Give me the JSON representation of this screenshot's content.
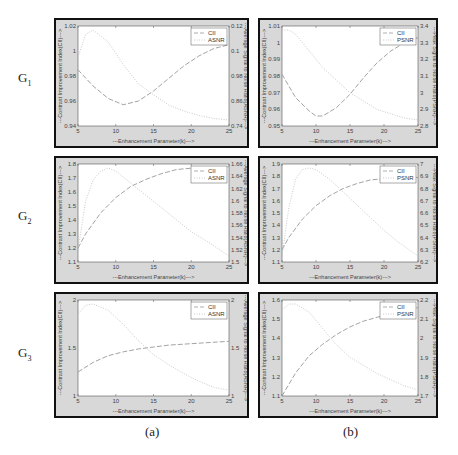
{
  "figure": {
    "row_labels": [
      "G",
      "G",
      "G"
    ],
    "row_subs": [
      "1",
      "2",
      "3"
    ],
    "col_captions": [
      "(a)",
      "(b)"
    ]
  },
  "chart_data": [
    {
      "id": "G1a",
      "type": "line",
      "row": "G1",
      "col": "(a)",
      "xlabel": "---Enhancement Parameter(k)--->",
      "ylabel_left": "---Contrast Improvement Index(CII)--->",
      "ylabel_right": "---Average Signal to Noise Ratio(ASNR)--->",
      "x_ticks": [
        "5",
        "10",
        "15",
        "20",
        "25"
      ],
      "xlim": [
        5,
        25
      ],
      "yleft_ticks": [
        "0.94",
        "0.96",
        "0.98",
        "1",
        "1.02"
      ],
      "ylim_left": [
        0.94,
        1.02
      ],
      "yright_ticks": [
        "0.74",
        "0.86",
        "0.98",
        "0.1",
        "0.12"
      ],
      "legend": [
        "CII",
        "ASNR"
      ],
      "series": [
        {
          "name": "CII",
          "axis": "left",
          "x": [
            5,
            7,
            9,
            11,
            13,
            15,
            17,
            19,
            21,
            23,
            25
          ],
          "values": [
            0.985,
            0.972,
            0.962,
            0.957,
            0.96,
            0.968,
            0.978,
            0.988,
            0.996,
            1.002,
            1.005
          ]
        },
        {
          "name": "ASNR",
          "axis": "right",
          "x": [
            5,
            6,
            7,
            9,
            11,
            13,
            15,
            17,
            19,
            21,
            23,
            25
          ],
          "values": [
            0.98,
            0.995,
            0.998,
            0.99,
            0.975,
            0.962,
            0.955,
            0.948,
            0.944,
            0.941,
            0.939,
            0.938
          ]
        }
      ]
    },
    {
      "id": "G1b",
      "type": "line",
      "row": "G1",
      "col": "(b)",
      "xlabel": "---Enhancement Parameter(k)--->",
      "ylabel_left": "---Contrast Improvement Index(CII)--->",
      "ylabel_right": "---Peak Signal to Noise Ratio(PSNR)--->",
      "x_ticks": [
        "5",
        "10",
        "15",
        "20",
        "25"
      ],
      "xlim": [
        5,
        25
      ],
      "yleft_ticks": [
        "0.95",
        "0.96",
        "0.97",
        "0.98",
        "0.99",
        "1",
        "1.01"
      ],
      "ylim_left": [
        0.95,
        1.01
      ],
      "yright_ticks": [
        "2.8",
        "2.9",
        "3",
        "3.1",
        "3.2",
        "3.3",
        "3.4"
      ],
      "legend": [
        "CII",
        "PSNR"
      ],
      "series": [
        {
          "name": "CII",
          "axis": "left",
          "x": [
            5,
            7,
            9,
            10,
            11,
            13,
            15,
            17,
            19,
            21,
            23,
            25
          ],
          "values": [
            0.981,
            0.967,
            0.959,
            0.956,
            0.956,
            0.961,
            0.969,
            0.979,
            0.988,
            0.995,
            1.0,
            1.003
          ]
        },
        {
          "name": "PSNR",
          "axis": "right",
          "x": [
            5,
            6,
            7,
            9,
            11,
            13,
            15,
            17,
            19,
            21,
            23,
            25
          ],
          "values": [
            3.3,
            3.3,
            3.28,
            3.2,
            3.12,
            3.06,
            3.0,
            2.96,
            2.92,
            2.9,
            2.88,
            2.87
          ]
        }
      ]
    },
    {
      "id": "G2a",
      "type": "line",
      "row": "G2",
      "col": "(a)",
      "xlabel": "---Enhancement Parameter(k)--->",
      "ylabel_left": "---Contrast Improvement Index(CII)--->",
      "ylabel_right": "---Average Signal to Noise Ratio(ASNR)--->",
      "x_ticks": [
        "5",
        "10",
        "15",
        "20",
        "25"
      ],
      "xlim": [
        5,
        25
      ],
      "yleft_ticks": [
        "1.1",
        "1.2",
        "1.3",
        "1.4",
        "1.5",
        "1.6",
        "1.7",
        "1.8"
      ],
      "ylim_left": [
        1.1,
        1.8
      ],
      "yright_ticks": [
        "1.5",
        "1.52",
        "1.54",
        "1.56",
        "1.58",
        "1.6",
        "1.62",
        "1.64",
        "1.66"
      ],
      "legend": [
        "CII",
        "ASNR"
      ],
      "series": [
        {
          "name": "CII",
          "axis": "left",
          "x": [
            5,
            6,
            8,
            10,
            12,
            14,
            16,
            18,
            20,
            22,
            25
          ],
          "values": [
            1.2,
            1.3,
            1.45,
            1.56,
            1.64,
            1.69,
            1.73,
            1.76,
            1.77,
            1.77,
            1.78
          ]
        },
        {
          "name": "ASNR",
          "axis": "right",
          "x": [
            5,
            6,
            7,
            8,
            9,
            10,
            12,
            14,
            16,
            18,
            20,
            22,
            25
          ],
          "values": [
            1.52,
            1.6,
            1.635,
            1.65,
            1.655,
            1.65,
            1.63,
            1.61,
            1.59,
            1.57,
            1.55,
            1.535,
            1.51
          ]
        }
      ]
    },
    {
      "id": "G2b",
      "type": "line",
      "row": "G2",
      "col": "(b)",
      "xlabel": "---Enhancement Parameter(k)--->",
      "ylabel_left": "---Contrast Improvement Index(CII)--->",
      "ylabel_right": "---Peak Signal to Noise Ratio(PSNR)--->",
      "x_ticks": [
        "5",
        "10",
        "15",
        "20",
        "25"
      ],
      "xlim": [
        5,
        25
      ],
      "yleft_ticks": [
        "1.1",
        "1.2",
        "1.3",
        "1.4",
        "1.5",
        "1.6",
        "1.7",
        "1.8",
        "1.9"
      ],
      "ylim_left": [
        1.1,
        1.9
      ],
      "yright_ticks": [
        "6.2",
        "6.3",
        "6.4",
        "6.5",
        "6.6",
        "6.7",
        "6.8",
        "6.9",
        "7"
      ],
      "legend": [
        "CII",
        "PSNR"
      ],
      "series": [
        {
          "name": "CII",
          "axis": "left",
          "x": [
            5,
            6,
            8,
            10,
            12,
            14,
            16,
            18,
            20,
            22,
            25
          ],
          "values": [
            1.2,
            1.3,
            1.45,
            1.56,
            1.64,
            1.7,
            1.74,
            1.77,
            1.78,
            1.79,
            1.79
          ]
        },
        {
          "name": "PSNR",
          "axis": "right",
          "x": [
            5,
            6,
            7,
            8,
            9,
            10,
            12,
            14,
            16,
            18,
            20,
            22,
            25
          ],
          "values": [
            6.3,
            6.6,
            6.78,
            6.84,
            6.85,
            6.84,
            6.78,
            6.7,
            6.62,
            6.54,
            6.46,
            6.39,
            6.3
          ]
        }
      ]
    },
    {
      "id": "G3a",
      "type": "line",
      "row": "G3",
      "col": "(a)",
      "xlabel": "---Enhancement Parameter(k)--->",
      "ylabel_left": "---Contrast Improvement Index(CII)--->",
      "ylabel_right": "---Average Signal to Noise Ratio(ASNR)--->",
      "x_ticks": [
        "5",
        "10",
        "15",
        "20",
        "25"
      ],
      "xlim": [
        5,
        25
      ],
      "yleft_ticks": [
        "1",
        "1.5",
        "2"
      ],
      "ylim_left": [
        1,
        2
      ],
      "yright_ticks": [
        "1",
        "1.5",
        "2"
      ],
      "legend": [
        "CII",
        "ASNR"
      ],
      "series": [
        {
          "name": "CII",
          "axis": "left",
          "x": [
            5,
            7,
            9,
            11,
            13,
            15,
            17,
            19,
            21,
            23,
            25
          ],
          "values": [
            1.25,
            1.35,
            1.42,
            1.46,
            1.49,
            1.51,
            1.53,
            1.54,
            1.55,
            1.56,
            1.57
          ]
        },
        {
          "name": "ASNR",
          "axis": "right",
          "x": [
            5,
            6,
            7,
            9,
            11,
            13,
            15,
            17,
            19,
            21,
            23,
            25
          ],
          "values": [
            1.85,
            1.92,
            1.93,
            1.88,
            1.77,
            1.64,
            1.53,
            1.45,
            1.38,
            1.32,
            1.27,
            1.25
          ]
        }
      ]
    },
    {
      "id": "G3b",
      "type": "line",
      "row": "G3",
      "col": "(b)",
      "xlabel": "---Enhancement Parameter(k)--->",
      "ylabel_left": "---Contrast Improvement Index(CII)--->",
      "ylabel_right": "---Peak Signal to Noise Ratio(PSNR)--->",
      "x_ticks": [
        "5",
        "10",
        "15",
        "20",
        "25"
      ],
      "xlim": [
        5,
        25
      ],
      "yleft_ticks": [
        "1.1",
        "1.2",
        "1.3",
        "1.4",
        "1.5",
        "1.6"
      ],
      "ylim_left": [
        1.1,
        1.6
      ],
      "yright_ticks": [
        "1.7",
        "1.8",
        "1.9",
        "2",
        "2.1",
        "2.2"
      ],
      "legend": [
        "CII",
        "PSNR"
      ],
      "series": [
        {
          "name": "CII",
          "axis": "left",
          "x": [
            5,
            7,
            9,
            11,
            13,
            15,
            17,
            19,
            21,
            23,
            25
          ],
          "values": [
            1.1,
            1.22,
            1.31,
            1.37,
            1.42,
            1.46,
            1.49,
            1.51,
            1.53,
            1.55,
            1.56
          ]
        },
        {
          "name": "PSNR",
          "axis": "right",
          "x": [
            5,
            6,
            7,
            9,
            11,
            13,
            15,
            17,
            19,
            21,
            23,
            25
          ],
          "values": [
            2.15,
            2.18,
            2.18,
            2.14,
            2.06,
            1.98,
            1.92,
            1.88,
            1.84,
            1.81,
            1.78,
            1.76
          ]
        }
      ]
    }
  ]
}
